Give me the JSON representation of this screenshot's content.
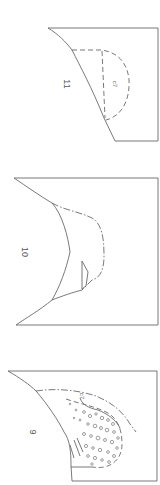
{
  "figure": {
    "profiles": [
      {
        "id": "profile-11",
        "label": "11",
        "layer_label": "c7"
      },
      {
        "id": "profile-10",
        "label": "10"
      },
      {
        "id": "profile-9",
        "label": "9",
        "layer_label": "c7"
      }
    ],
    "colors": {
      "line": "#6a6a6a",
      "background": "#ffffff"
    }
  }
}
